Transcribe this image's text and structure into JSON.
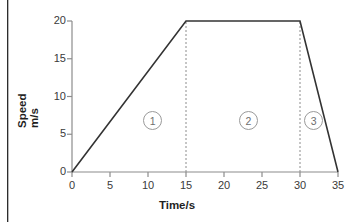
{
  "chart_data": {
    "type": "line",
    "title": "",
    "xlabel": "Time/s",
    "ylabel_line1": "Speed",
    "ylabel_line2": "m/s",
    "xlim": [
      0,
      35
    ],
    "ylim": [
      0,
      20
    ],
    "xticks": [
      0,
      5,
      10,
      15,
      20,
      25,
      30,
      35
    ],
    "xtick_labels": [
      "0",
      "5",
      "10",
      "15",
      "20",
      "25",
      "30",
      "35"
    ],
    "yticks": [
      0,
      5,
      10,
      15,
      20
    ],
    "ytick_labels": [
      "0",
      "5",
      "10",
      "15",
      "20"
    ],
    "grid": false,
    "legend": false,
    "series": [
      {
        "name": "Speed",
        "x": [
          0,
          15,
          30,
          35
        ],
        "values": [
          0,
          20,
          20,
          0
        ],
        "color": "#333333"
      }
    ],
    "guide_lines": [
      {
        "name": "divider-15s",
        "x": 15,
        "y_from": 0,
        "y_to": 20,
        "style": "dashed",
        "color": "#8c8c8c"
      },
      {
        "name": "divider-30s",
        "x": 30,
        "y_from": 0,
        "y_to": 20,
        "style": "dashed",
        "color": "#8c8c8c"
      }
    ],
    "annotations": [
      {
        "label": "1",
        "x": 10.6,
        "y": 6.8,
        "shape": "circle"
      },
      {
        "label": "2",
        "x": 23.2,
        "y": 6.8,
        "shape": "circle"
      },
      {
        "label": "3",
        "x": 31.8,
        "y": 6.8,
        "shape": "circle"
      }
    ],
    "colors": {
      "curve": "#333333",
      "axis": "#8c8c8c",
      "dashed": "#8c8c8c",
      "text": "#3a3a3a",
      "annotation": "#6e6e6e",
      "background": "#ffffff"
    }
  }
}
